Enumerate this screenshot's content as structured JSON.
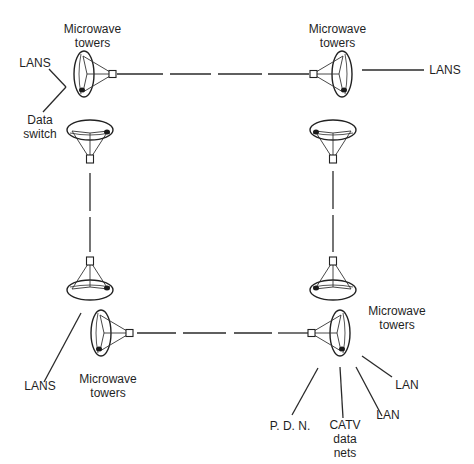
{
  "diagram": {
    "labels": {
      "top_left_towers": "Microwave\ntowers",
      "top_right_towers": "Microwave\ntowers",
      "bottom_left_towers": "Microwave\ntowers",
      "bottom_right_towers": "Microwave\ntowers",
      "top_left_lans": "LANS",
      "data_switch": "Data\nswitch",
      "top_right_lans": "LANS",
      "bottom_left_lans": "LANS",
      "pdn": "P. D. N.",
      "catv": "CATV\ndata\nnets",
      "lan_1": "LAN",
      "lan_2": "LAN"
    },
    "nodes": [
      {
        "id": "tl",
        "name": "top-left microwave tower pair"
      },
      {
        "id": "tr",
        "name": "top-right microwave tower pair"
      },
      {
        "id": "bl",
        "name": "bottom-left microwave tower pair"
      },
      {
        "id": "br",
        "name": "bottom-right microwave tower pair"
      }
    ],
    "links": [
      {
        "from": "tl",
        "to": "tr",
        "style": "dashed"
      },
      {
        "from": "tl",
        "to": "bl",
        "style": "dashed"
      },
      {
        "from": "tr",
        "to": "br",
        "style": "dashed"
      },
      {
        "from": "bl",
        "to": "br",
        "style": "dashed"
      }
    ],
    "colors": {
      "line": "#2a2a2a",
      "background": "#ffffff"
    }
  }
}
